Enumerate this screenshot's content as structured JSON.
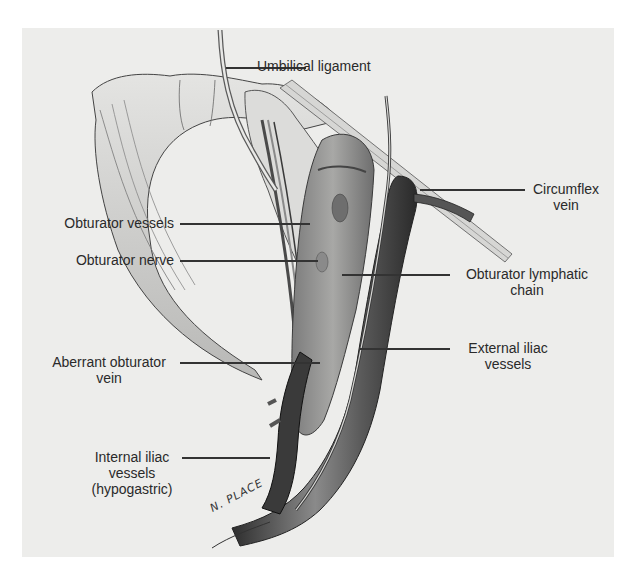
{
  "figure": {
    "type": "anatomical-illustration",
    "signature": "N. PLACE",
    "colors": {
      "background": "#ffffff",
      "panel": "#ededeb",
      "ink": "#2a2a2a",
      "vessel_dark": "#3a3a3a",
      "vessel_mid": "#7a7a7a",
      "tissue_light": "#c9c9c6"
    },
    "labels": {
      "umbilical_ligament": "Umbilical ligament",
      "circumflex_vein_line1": "Circumflex",
      "circumflex_vein_line2": "vein",
      "obturator_vessels": "Obturator vessels",
      "obturator_nerve": "Obturator nerve",
      "obturator_lymphatic_line1": "Obturator lymphatic",
      "obturator_lymphatic_line2": "chain",
      "aberrant_obturator_line1": "Aberrant obturator",
      "aberrant_obturator_line2": "vein",
      "external_iliac_line1": "External iliac",
      "external_iliac_line2": "vessels",
      "internal_iliac_line1": "Internal iliac",
      "internal_iliac_line2": "vessels",
      "internal_iliac_line3": "(hypogastric)"
    }
  }
}
